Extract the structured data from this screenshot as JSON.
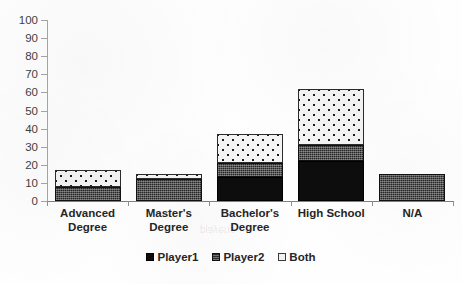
{
  "chart_data": {
    "type": "bar",
    "subtype": "stacked-bar",
    "title": "",
    "xlabel": "",
    "ylabel": "",
    "ylim": [
      0,
      100
    ],
    "ytick_step": 10,
    "yticks": [
      100,
      90,
      80,
      70,
      60,
      50,
      40,
      30,
      20,
      10,
      0
    ],
    "grid": false,
    "legend_position": "bottom",
    "categories": [
      "Advanced Degree",
      "Master's Degree",
      "Bachelor's Degree",
      "High School",
      "N/A"
    ],
    "category_lines": [
      [
        "Advanced",
        "Degree"
      ],
      [
        "Master's",
        "Degree"
      ],
      [
        "Bachelor's",
        "Degree"
      ],
      [
        "High School",
        ""
      ],
      [
        "N/A",
        ""
      ]
    ],
    "series": [
      {
        "name": "Player1",
        "values": [
          0,
          0,
          13,
          22,
          0
        ],
        "fill": "solid-black",
        "color": "#0d0d0d"
      },
      {
        "name": "Player2",
        "values": [
          8,
          12,
          8,
          9,
          15
        ],
        "fill": "crosshatch-dark",
        "color": "#262626"
      },
      {
        "name": "Both",
        "values": [
          9,
          3,
          16,
          31,
          0
        ],
        "fill": "dotted-white",
        "color": "#f4f4f4"
      }
    ],
    "totals": [
      17,
      15,
      37,
      62,
      15
    ]
  },
  "legend": {
    "items": [
      {
        "label": "Player1",
        "swatch": "solid-black-swatch"
      },
      {
        "label": "Player2",
        "swatch": "crosshatch-swatch"
      },
      {
        "label": "Both",
        "swatch": "outlined-white-swatch"
      }
    ]
  },
  "axis": {
    "y_tick_labels": [
      "100",
      "90",
      "80",
      "70",
      "60",
      "50",
      "40",
      "30",
      "20",
      "10",
      "0"
    ]
  }
}
